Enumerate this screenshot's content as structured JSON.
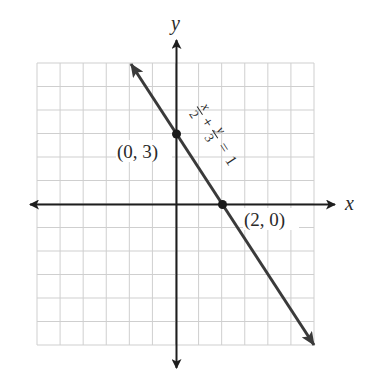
{
  "chart_data": {
    "type": "line",
    "title": "",
    "xlabel": "x",
    "ylabel": "y",
    "xlim": [
      -6,
      6
    ],
    "ylim": [
      -6,
      6
    ],
    "grid": true,
    "grid_step": 1,
    "series": [
      {
        "name": "x/2 + y/3 = 1",
        "equation": "x/2 + y/3 = 1",
        "x": [
          -2,
          6
        ],
        "y": [
          6,
          -6
        ],
        "arrows": "both",
        "color": "#3a3a3a"
      }
    ],
    "points": [
      {
        "x": 0,
        "y": 3,
        "label": "(0, 3)"
      },
      {
        "x": 2,
        "y": 0,
        "label": "(2, 0)"
      }
    ],
    "annotations": [
      {
        "text": "x/2 + y/3 = 1",
        "position": "along line, upper right of (0, 3)"
      }
    ]
  },
  "labels": {
    "x_axis": "x",
    "y_axis": "y",
    "point_a": "(0, 3)",
    "point_b": "(2, 0)",
    "eq_x": "x",
    "eq_2": "2",
    "eq_plus": "+",
    "eq_y": "y",
    "eq_3": "3",
    "eq_equals": "=",
    "eq_1": "1"
  },
  "colors": {
    "grid": "#cfcfcf",
    "axis": "#1e1e1e",
    "line": "#3a3a3a",
    "point": "#1a1a1a",
    "text": "#2a2a2a"
  }
}
